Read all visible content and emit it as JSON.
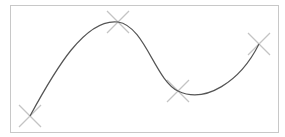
{
  "diagram": {
    "type": "spline-with-control-points",
    "frame": {
      "x": 10,
      "y": 5,
      "width": 269,
      "height": 128,
      "border_color": "#c8c8c8"
    },
    "curve": {
      "stroke": "#555555",
      "stroke_width": 1.2,
      "path": "M30,116 C55,70 85,18 118,22 C145,26 155,80 178,91 C205,104 240,82 259,44"
    },
    "control_points": [
      {
        "id": "p1",
        "x": 30,
        "y": 116
      },
      {
        "id": "p2",
        "x": 118,
        "y": 22
      },
      {
        "id": "p3",
        "x": 178,
        "y": 91
      },
      {
        "id": "p4",
        "x": 259,
        "y": 44
      }
    ],
    "marker": {
      "shape": "x-cross",
      "half_size": 11,
      "color": "#c4c4c4",
      "stroke_width": 1.2
    }
  }
}
